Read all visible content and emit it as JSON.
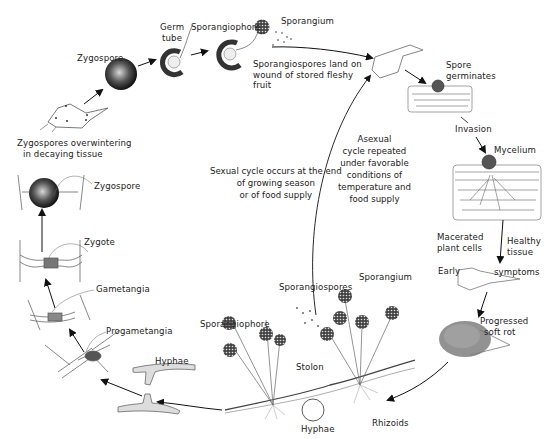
{
  "diagram": {
    "type": "life-cycle",
    "center_notes": {
      "sexual": [
        "Sexual cycle occurs at the end",
        "of growing season",
        "or of food    supply"
      ],
      "asexual": [
        "Asexual",
        "cycle repeated",
        "under favorable",
        "conditions    of",
        "temperature    and",
        "food supply"
      ]
    },
    "labels": {
      "zygospore_top": "Zygospore",
      "germ_tube": [
        "Germ",
        "tube"
      ],
      "sporangiophore_top": "Sporangiophore",
      "sporangium_top": "Sporangium",
      "spores_land": [
        "Sporangiospores land on",
        "wound of stored fleshy",
        "fruit"
      ],
      "spore_germinates": [
        "Spore",
        "germinates"
      ],
      "invasion": "Invasion",
      "mycelium": "Mycelium",
      "macerated": [
        "Macerated",
        "plant cells"
      ],
      "healthy": [
        "Healthy",
        "tissue"
      ],
      "early": "Early",
      "symptoms": "symptoms",
      "progressed": [
        "Progressed",
        "soft rot"
      ],
      "sporangium_bottom": "Sporangium",
      "sporangiospores_bottom": "Sporangiospores",
      "sporangiophore_bottom": "Sporangiophore",
      "stolon": "Stolon",
      "rhizoids": "Rhizoids",
      "hyphae_bottom": "Hyphae",
      "hyphae_left": "Hyphae",
      "progametangia": "Progametangia",
      "gametangia": "Gametangia",
      "zygote": "Zygote",
      "zygospore_left": "Zygospore",
      "overwintering": [
        "Zygospores overwintering",
        "in decaying tissue"
      ]
    }
  }
}
